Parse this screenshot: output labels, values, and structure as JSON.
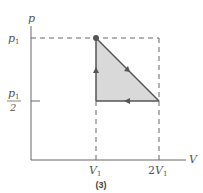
{
  "diagram": {
    "caption": "(3)",
    "axes": {
      "y_label": "p",
      "x_label": "V"
    },
    "ticks": {
      "y": [
        {
          "id": "p1",
          "label": "p",
          "sub": "1"
        },
        {
          "id": "p1_half",
          "numerator": "p",
          "num_sub": "1",
          "denominator": "2"
        }
      ],
      "x": [
        {
          "id": "V1",
          "label": "V",
          "sub": "1"
        },
        {
          "id": "2V1",
          "prefix": "2",
          "label": "V",
          "sub": "1"
        }
      ]
    },
    "cycle": {
      "vertices": [
        {
          "name": "A",
          "V": "V1",
          "p": "p1"
        },
        {
          "name": "B",
          "V": "2V1",
          "p": "p1/2"
        },
        {
          "name": "C",
          "V": "V1",
          "p": "p1/2"
        }
      ],
      "direction": [
        "A->B",
        "B->C",
        "C->A"
      ],
      "fill_color": "#d9d9d9",
      "line_color": "#555555"
    }
  }
}
